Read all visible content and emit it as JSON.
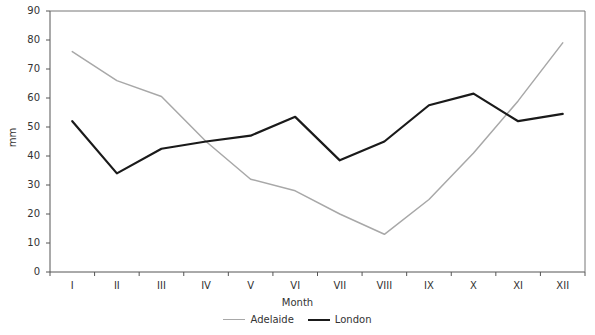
{
  "chart_data": {
    "type": "line",
    "title": "",
    "xlabel": "Month",
    "ylabel": "mm",
    "categories": [
      "I",
      "II",
      "III",
      "IV",
      "V",
      "VI",
      "VII",
      "VIII",
      "IX",
      "X",
      "XI",
      "XII"
    ],
    "series": [
      {
        "name": "Adelaide",
        "color": "#a8a8a8",
        "values": [
          76,
          66,
          60.5,
          45,
          32,
          28,
          20,
          13,
          25,
          41,
          59,
          79
        ]
      },
      {
        "name": "London",
        "color": "#1a1a1a",
        "values": [
          52,
          34,
          42.5,
          45,
          47,
          53.5,
          38.5,
          45,
          57.5,
          61.5,
          52,
          54.5
        ]
      }
    ],
    "ylim": [
      0,
      90
    ],
    "ytick_values": [
      0,
      10,
      20,
      30,
      40,
      50,
      60,
      70,
      80,
      90
    ],
    "ytick_labels": [
      "0",
      "10",
      "20",
      "30",
      "40",
      "50",
      "60",
      "70",
      "80",
      "90"
    ],
    "grid": false,
    "legend_position": "bottom-center"
  },
  "axes": {
    "y_title": "mm",
    "x_title": "Month"
  },
  "legend": {
    "items": [
      {
        "label": "Adelaide",
        "color": "#a8a8a8",
        "thickness": "1.6"
      },
      {
        "label": "London",
        "color": "#1a1a1a",
        "thickness": "2.4"
      }
    ]
  },
  "artifacts": {
    "top_clipped_text": " "
  }
}
